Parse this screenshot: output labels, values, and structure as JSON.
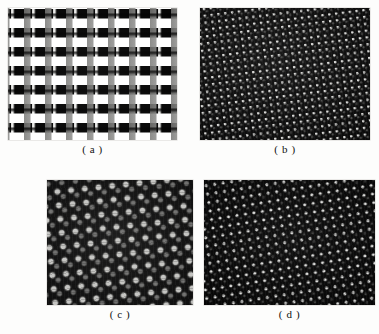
{
  "figure": {
    "background_color": "#fdfdfc",
    "panel_count": 4,
    "panels": [
      {
        "id": "a",
        "caption": "( a )",
        "kind": "micrograph",
        "description": "rectangular grid of bright vertical bars with dim gray square blocks on black background",
        "lattice": "square",
        "background_color": "#050505",
        "feature_color": "#f5f5f3",
        "rect": {
          "x": 8,
          "y": 8,
          "w": 169,
          "h": 132
        }
      },
      {
        "id": "b",
        "caption": "( b )",
        "kind": "micrograph",
        "description": "very dense tilted square lattice of tiny bright dots",
        "lattice": "square-tilted",
        "background_color": "#0a0a0a",
        "feature_color": "#e2e2e0",
        "rect": {
          "x": 200,
          "y": 8,
          "w": 170,
          "h": 132
        }
      },
      {
        "id": "c",
        "caption": "( c )",
        "kind": "micrograph",
        "description": "coarse tilted lattice of large gray dots, brightest panel",
        "lattice": "quasi-hexagonal-tilted",
        "background_color": "#0d0d0d",
        "feature_color": "#cdcdca",
        "rect": {
          "x": 47,
          "y": 180,
          "w": 146,
          "h": 125
        }
      },
      {
        "id": "d",
        "caption": "( d )",
        "kind": "micrograph",
        "description": "fine sparse bright dots on very dark ground in a tilted lattice",
        "lattice": "square-tilted",
        "background_color": "#060606",
        "feature_color": "#eeeeec",
        "rect": {
          "x": 204,
          "y": 180,
          "w": 171,
          "h": 125
        }
      }
    ]
  }
}
